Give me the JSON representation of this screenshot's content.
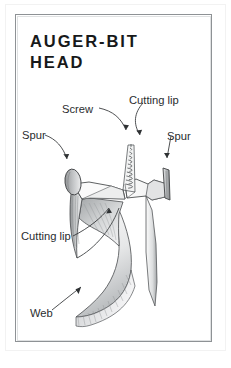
{
  "figure": {
    "title": "AUGER-BIT\nHEAD",
    "title_lines": [
      "AUGER-BIT",
      "HEAD"
    ],
    "kind": "technical-illustration",
    "style": "pencil line drawing with graphite shading",
    "colors": {
      "page_background": "#ffffff",
      "frame_border": "#8e9295",
      "title_text": "#17191a",
      "label_text": "#2a2d2f",
      "ink_line": "#3a3d40",
      "shade_light": "#e9eaeb",
      "shade_mid": "#c8cacb",
      "shade_dark": "#9b9ea0"
    },
    "labels": [
      {
        "id": "screw",
        "text": "Screw",
        "points_to": "threaded conical screw point at center of head"
      },
      {
        "id": "cutting-lip-top",
        "text": "Cutting lip",
        "points_to": "right-hand angled cutting edge on head shoulder"
      },
      {
        "id": "spur-left",
        "text": "Spur",
        "points_to": "left spur, oval blade at outer rim"
      },
      {
        "id": "spur-right",
        "text": "Spur",
        "points_to": "right spur, narrow blade at outer rim"
      },
      {
        "id": "cutting-lip-bottom",
        "text": "Cutting lip",
        "points_to": "left-hand cutting edge inside throat"
      },
      {
        "id": "web",
        "text": "Web",
        "points_to": "helical web of the twisted body"
      }
    ],
    "parts": [
      "screw point",
      "left spur",
      "right spur",
      "cutting lip (left)",
      "cutting lip (right)",
      "throat",
      "twist / web"
    ]
  }
}
